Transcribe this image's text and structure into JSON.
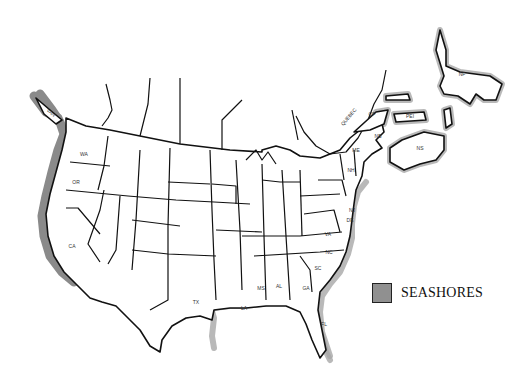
{
  "map": {
    "title": "",
    "seashore_color": "#909090",
    "border_color": "#111111",
    "labels": {
      "wa": "WA",
      "or": "OR",
      "ca": "CA",
      "tx": "TX",
      "la": "LA",
      "ms": "MS",
      "al": "AL",
      "ga": "GA",
      "fl": "FL",
      "sc": "SC",
      "nc": "NC",
      "va": "VA",
      "nj": "NJ",
      "de": "DE",
      "me": "ME",
      "nb": "NB",
      "ns": "NS",
      "pe": "PEI",
      "qp": "QP",
      "nf": "NF",
      "quebec": "QUEBEC",
      "van": "VAN",
      "nh": "NH"
    }
  },
  "legend": {
    "swatch_label": "SEASHORES",
    "swatch_color": "#909090"
  }
}
